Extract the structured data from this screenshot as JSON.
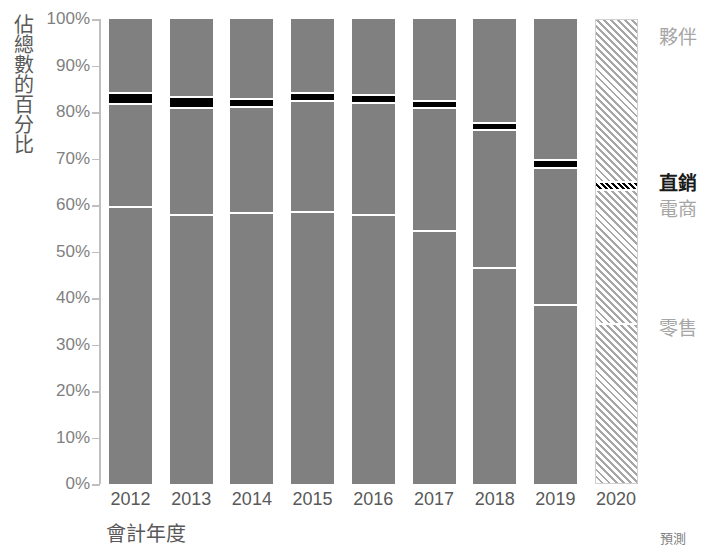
{
  "chart_data": {
    "type": "bar",
    "subtype": "100% stacked column",
    "title": "",
    "xlabel": "會計年度",
    "ylabel": "佔總數的百分比",
    "categories": [
      "2012",
      "2013",
      "2014",
      "2015",
      "2016",
      "2017",
      "2018",
      "2019",
      "2020"
    ],
    "ylim": [
      0,
      100
    ],
    "ytick_labels": [
      "0%",
      "10%",
      "20%",
      "30%",
      "40%",
      "50%",
      "60%",
      "70%",
      "80%",
      "90%",
      "100%"
    ],
    "ytick_values": [
      0,
      10,
      20,
      30,
      40,
      50,
      60,
      70,
      80,
      90,
      100
    ],
    "grid": false,
    "legend_position": "right",
    "value_unit": "%",
    "forecast_categories": [
      "2020"
    ],
    "forecast_note": "預測",
    "series": [
      {
        "name": "零售",
        "style": "solid-gray",
        "color": "#808080",
        "values": [
          59.5,
          57.8,
          58.3,
          58.5,
          57.8,
          54.4,
          46.5,
          38.5,
          34.4
        ]
      },
      {
        "name": "電商",
        "style": "solid-gray",
        "color": "#808080",
        "values": [
          22.2,
          23.1,
          22.8,
          23.9,
          24.2,
          26.5,
          29.6,
          29.4,
          28.9
        ]
      },
      {
        "name": "直銷",
        "style": "solid-black",
        "color": "#000000",
        "values": [
          2.4,
          2.3,
          1.7,
          1.7,
          1.7,
          1.5,
          1.5,
          1.8,
          1.7
        ]
      },
      {
        "name": "夥伴",
        "style": "solid-gray",
        "color": "#808080",
        "values": [
          15.9,
          16.8,
          17.2,
          15.9,
          16.3,
          17.6,
          22.4,
          30.3,
          35.0
        ]
      }
    ],
    "boundaries": {
      "note": "cumulative % from bottom: top of 零售, top of 電商, top of 直銷",
      "retail_top": [
        59.5,
        57.8,
        58.3,
        58.5,
        57.8,
        54.4,
        46.5,
        38.5,
        34.4
      ],
      "ecom_top": [
        81.7,
        80.9,
        81.1,
        82.4,
        82.0,
        80.9,
        76.1,
        67.9,
        63.3
      ],
      "direct_top": [
        84.1,
        83.2,
        82.8,
        84.1,
        83.7,
        82.4,
        77.6,
        69.7,
        65.0
      ]
    }
  },
  "series_labels": [
    {
      "text": "夥伴",
      "emphasis": false,
      "top": 22
    },
    {
      "text": "直銷",
      "emphasis": true,
      "top": 168
    },
    {
      "text": "電商",
      "emphasis": false,
      "top": 194
    },
    {
      "text": "零售",
      "emphasis": false,
      "top": 313
    }
  ],
  "colors": {
    "bar_gray": "#808080",
    "bar_black": "#000000",
    "axis": "#bfbfbf",
    "tick_text": "#7f7f7f",
    "label_text": "#595959",
    "series_label": "#a6a6a6",
    "emphasis_label": "#1a1a1a",
    "background": "#ffffff"
  }
}
